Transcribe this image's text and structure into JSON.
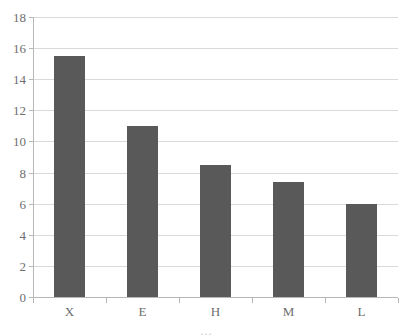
{
  "chart_data": {
    "type": "bar",
    "title": "",
    "subtitle": "",
    "xlabel": "",
    "ylabel": "",
    "categories": [
      "X",
      "E",
      "H",
      "M",
      "L"
    ],
    "values": [
      15.5,
      11.0,
      8.5,
      7.4,
      6.0
    ],
    "series": [
      {
        "name": "Series 1",
        "values": [
          15.5,
          11.0,
          8.5,
          7.4,
          6.0
        ],
        "color": "#595959"
      }
    ],
    "ylim": [
      0,
      18
    ],
    "y_ticks": [
      0,
      2,
      4,
      6,
      8,
      10,
      12,
      14,
      16,
      18
    ],
    "y_tick_labels": [
      "0",
      "2",
      "4",
      "6",
      "8",
      "10",
      "12",
      "14",
      "16",
      "18"
    ],
    "x_tick_labels": [
      "X",
      "E",
      "H",
      "M",
      "L"
    ],
    "grid": true,
    "grid_axis": "y",
    "grid_color": "#d9d9d9",
    "axis_color": "#b7b7b7",
    "tick_label_color": "#6e6e6e",
    "legend": false,
    "legend_position": "none",
    "annotations": [],
    "background_color": "#ffffff",
    "clipped_bottom_text": "…"
  }
}
